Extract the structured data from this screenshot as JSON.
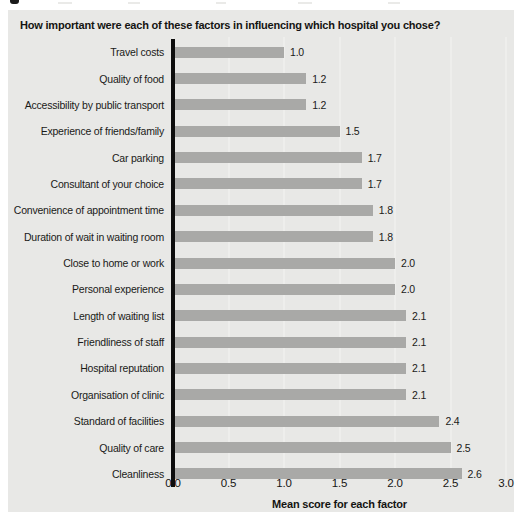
{
  "chart_data": {
    "type": "bar",
    "orientation": "horizontal",
    "title": "How important were each of these factors in influencing which hospital you chose?",
    "xlabel": "Mean score for each factor",
    "categories": [
      "Travel costs",
      "Quality of food",
      "Accessibility by public transport",
      "Experience of friends/family",
      "Car parking",
      "Consultant of your choice",
      "Convenience of appointment time",
      "Duration of wait in waiting room",
      "Close to home or work",
      "Personal experience",
      "Length of waiting list",
      "Friendliness of staff",
      "Hospital reputation",
      "Organisation of clinic",
      "Standard of facilities",
      "Quality of care",
      "Cleanliness"
    ],
    "values": [
      1.0,
      1.2,
      1.2,
      1.5,
      1.7,
      1.7,
      1.8,
      1.8,
      2.0,
      2.0,
      2.1,
      2.1,
      2.1,
      2.1,
      2.4,
      2.5,
      2.6
    ],
    "value_labels": [
      "1.0",
      "1.2",
      "1.2",
      "1.5",
      "1.7",
      "1.7",
      "1.8",
      "1.8",
      "2.0",
      "2.0",
      "2.1",
      "2.1",
      "2.1",
      "2.1",
      "2.4",
      "2.5",
      "2.6"
    ],
    "xlim": [
      0,
      3
    ],
    "x_ticks": [
      "0.0",
      "0.5",
      "1.0",
      "1.5",
      "2.0",
      "2.5",
      "3.0"
    ],
    "grid": "vertical-faint",
    "legend": "none",
    "colors": {
      "panel_bg": "#e8e8e6",
      "bar": "#a9a9a7",
      "gridline": "#f3f3f1",
      "zero_line": "#0d0d0d",
      "text": "#1a1a18"
    }
  }
}
